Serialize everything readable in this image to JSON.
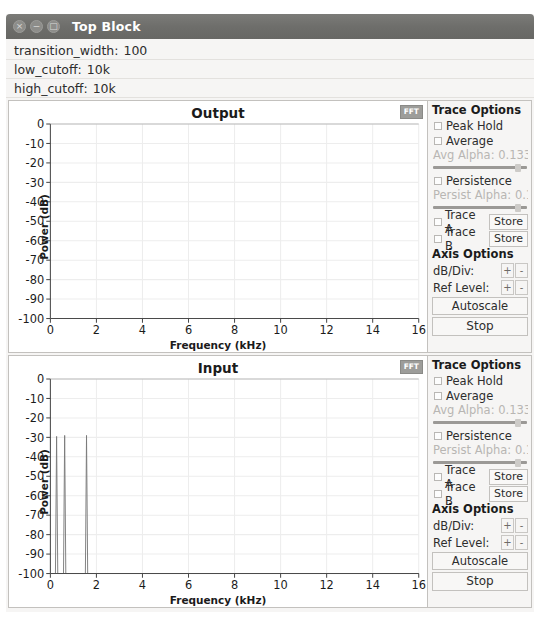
{
  "window": {
    "title": "Top Block",
    "buttons": [
      {
        "name": "close",
        "glyph": "×"
      },
      {
        "name": "minimize",
        "glyph": "−"
      },
      {
        "name": "maximize",
        "glyph": "□"
      }
    ]
  },
  "params": [
    {
      "label": "transition_width:",
      "value": "100"
    },
    {
      "label": "low_cutoff:",
      "value": "10k"
    },
    {
      "label": "high_cutoff:",
      "value": "10k"
    }
  ],
  "options_panel": {
    "trace_options_header": "Trace Options",
    "peak_hold_label": "Peak Hold",
    "average_label": "Average",
    "avg_alpha_label": "Avg Alpha: 0.1333",
    "persistence_label": "Persistence",
    "persist_alpha_label": "Persist Alpha: 0.18",
    "trace_a_label": "Trace A",
    "trace_b_label": "Trace B",
    "store_label": "Store",
    "axis_options_header": "Axis Options",
    "db_div_label": "dB/Div:",
    "ref_level_label": "Ref Level:",
    "plus_label": "+",
    "minus_label": "-",
    "autoscale_label": "Autoscale",
    "stop_label": "Stop"
  },
  "chart_data": [
    {
      "type": "line",
      "title": "Output",
      "xlabel": "Frequency (kHz)",
      "ylabel": "Power (dB)",
      "xlim": [
        0,
        16
      ],
      "ylim": [
        -100,
        0
      ],
      "xticks": [
        0,
        2,
        4,
        6,
        8,
        10,
        12,
        14,
        16
      ],
      "yticks": [
        0,
        -10,
        -20,
        -30,
        -40,
        -50,
        -60,
        -70,
        -80,
        -90,
        -100
      ],
      "grid": true,
      "fft_badge": "FFT",
      "series": [
        {
          "name": "trace",
          "color": "#6d6d6d",
          "points": []
        }
      ]
    },
    {
      "type": "line",
      "title": "Input",
      "xlabel": "Frequency (kHz)",
      "ylabel": "Power (dB)",
      "xlim": [
        0,
        16
      ],
      "ylim": [
        -100,
        0
      ],
      "xticks": [
        0,
        2,
        4,
        6,
        8,
        10,
        12,
        14,
        16
      ],
      "yticks": [
        0,
        -10,
        -20,
        -30,
        -40,
        -50,
        -60,
        -70,
        -80,
        -90,
        -100
      ],
      "grid": true,
      "fft_badge": "FFT",
      "peaks": [
        {
          "freq_khz": 0.27,
          "peak_db": -29.5,
          "width_khz": 0.1
        },
        {
          "freq_khz": 0.62,
          "peak_db": -29.0,
          "width_khz": 0.1
        },
        {
          "freq_khz": 1.57,
          "peak_db": -29.0,
          "width_khz": 0.1
        }
      ],
      "noise_floor_db": -100,
      "series": [
        {
          "name": "trace",
          "color": "#7a7a7a"
        }
      ]
    }
  ]
}
